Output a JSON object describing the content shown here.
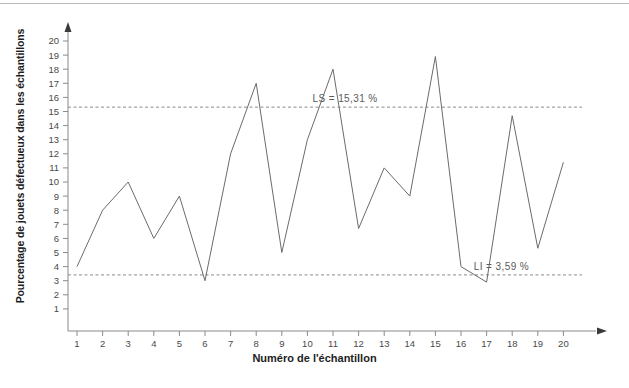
{
  "chart_data": {
    "type": "line",
    "title": "",
    "xlabel": "Numéro de l'échantillon",
    "ylabel": "Pourcentage de jouets défectueux dans les échantillons",
    "categories": [
      1,
      2,
      3,
      4,
      5,
      6,
      7,
      8,
      9,
      10,
      11,
      12,
      13,
      14,
      15,
      16,
      17,
      18,
      19,
      20
    ],
    "values": [
      4,
      8,
      10,
      6,
      9,
      3,
      12,
      17,
      5,
      13,
      18,
      6.7,
      11,
      9,
      18.9,
      4,
      2.9,
      14.7,
      5.3,
      11.4
    ],
    "x_tick_labels": [
      "1",
      "2",
      "3",
      "4",
      "5",
      "6",
      "7",
      "8",
      "9",
      "10",
      "11",
      "12",
      "13",
      "14",
      "15",
      "16",
      "17",
      "18",
      "19",
      "20"
    ],
    "y_tick_labels": [
      "1",
      "2",
      "3",
      "4",
      "5",
      "6",
      "7",
      "8",
      "9",
      "10",
      "11",
      "12",
      "13",
      "14",
      "15",
      "16",
      "17",
      "18",
      "19",
      "20"
    ],
    "y_ticks": [
      1,
      2,
      3,
      4,
      5,
      6,
      7,
      8,
      9,
      10,
      11,
      12,
      13,
      14,
      15,
      16,
      17,
      18,
      19,
      20
    ],
    "xlim": [
      0.5,
      20.8
    ],
    "ylim": [
      0,
      20.8
    ],
    "grid": false,
    "legend": null,
    "series_color": "#6b6b6b",
    "axis_color": "#8a8a8a",
    "annotations": [
      {
        "name": "upper-control-limit",
        "label": "LS = 15,31 %",
        "value": 15.31,
        "label_x": 10.2,
        "style": "dashed",
        "color": "#8a8a8a"
      },
      {
        "name": "lower-control-limit",
        "label": "LI = 3,59 %",
        "value": 3.41,
        "label_x": 16.5,
        "style": "dashed",
        "color": "#8a8a8a"
      }
    ]
  }
}
